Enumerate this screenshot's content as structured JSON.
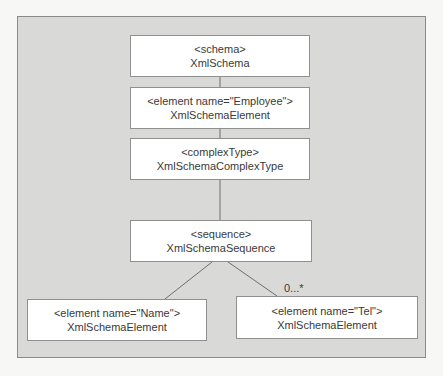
{
  "diagram": {
    "nodes": [
      {
        "id": "schema",
        "tag": "<schema>",
        "type": "XmlSchema"
      },
      {
        "id": "employee",
        "tag": "<element name=\"Employee\">",
        "type": "XmlSchemaElement"
      },
      {
        "id": "complexType",
        "tag": "<complexType>",
        "type": "XmlSchemaComplexType"
      },
      {
        "id": "sequence",
        "tag": "<sequence>",
        "type": "XmlSchemaSequence"
      },
      {
        "id": "name",
        "tag": "<element name=\"Name\">",
        "type": "XmlSchemaElement"
      },
      {
        "id": "tel",
        "tag": "<element name=\"Tel\">",
        "type": "XmlSchemaElement"
      }
    ],
    "edges": [
      {
        "from": "schema",
        "to": "employee"
      },
      {
        "from": "employee",
        "to": "complexType"
      },
      {
        "from": "complexType",
        "to": "sequence"
      },
      {
        "from": "sequence",
        "to": "name"
      },
      {
        "from": "sequence",
        "to": "tel",
        "label": "0...*"
      }
    ],
    "colors": {
      "panel": "#d9d9d7",
      "node": "#ffffff",
      "border": "#8f8f8f",
      "line": "#6f6f6f"
    }
  }
}
